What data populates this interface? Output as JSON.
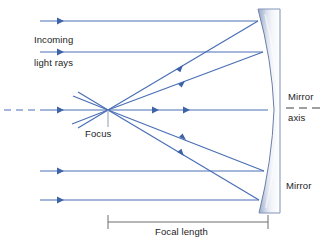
{
  "diagram": {
    "type": "optics-ray-diagram",
    "colors": {
      "ray": "#4a6fb5",
      "ray_light": "#7e9ed4",
      "mirror_dark": "#8c9dbe",
      "mirror_light": "#e8ecf5",
      "mirror_edge": "#6c7fa6",
      "text": "#1d1d1d",
      "dim_line": "#6d6d6d",
      "background": "#ffffff"
    },
    "labels": {
      "incoming": "Incoming",
      "light_rays": "light rays",
      "focus": "Focus",
      "mirror_axis_line1": "Mirror",
      "mirror_axis_line2": "axis",
      "mirror": "Mirror",
      "focal_length": "Focal length"
    },
    "geometry": {
      "focus_point": {
        "x": 108,
        "y": 110
      },
      "mirror_axis_y": 110,
      "mirror_vertex_x": 268,
      "mirror_top_y": 9,
      "mirror_bottom_y": 213,
      "incoming_ray_y_positions": [
        21,
        52,
        110,
        171,
        200
      ],
      "incoming_ray_start_x": 40,
      "dashed_axis": {
        "x_start": 4,
        "x_end": 45,
        "y": 110
      },
      "focal_length_bar": {
        "x_start": 108,
        "x_end": 268,
        "y": 222
      },
      "focus_tick": {
        "x": 108,
        "y_start": 110,
        "y_end": 126
      }
    },
    "ray_hits": [
      {
        "y": 21,
        "x": 258
      },
      {
        "y": 52,
        "x": 263
      },
      {
        "y": 110,
        "x": 268
      },
      {
        "y": 171,
        "x": 264
      },
      {
        "y": 200,
        "x": 259
      }
    ]
  }
}
